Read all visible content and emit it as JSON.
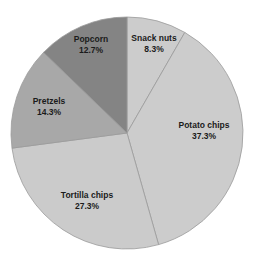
{
  "chart_data": {
    "type": "pie",
    "title": "",
    "subtitle": "",
    "xlabel": "",
    "ylabel": "",
    "grid": false,
    "legend_position": "none",
    "label_format": "name + percent",
    "start_angle_deg": 0,
    "direction": "clockwise",
    "categories": [
      "Snack nuts",
      "Potato chips",
      "Tortilla chips",
      "Pretzels",
      "Popcorn"
    ],
    "values": [
      8.3,
      37.3,
      27.3,
      14.3,
      12.7
    ],
    "units": "percent",
    "total": 99.9,
    "slices": [
      {
        "name": "Snack nuts",
        "percent_label": "8.3%",
        "value": 8.3,
        "color": "#cccccc",
        "start_deg": 0.0,
        "end_deg": 29.9
      },
      {
        "name": "Potato chips",
        "percent_label": "37.3%",
        "value": 37.3,
        "color": "#cccccc",
        "start_deg": 29.9,
        "end_deg": 164.2
      },
      {
        "name": "Tortilla chips",
        "percent_label": "27.3%",
        "value": 27.3,
        "color": "#cbcbcb",
        "start_deg": 164.2,
        "end_deg": 262.5
      },
      {
        "name": "Pretzels",
        "percent_label": "14.3%",
        "value": 14.3,
        "color": "#a8a8a8",
        "start_deg": 262.5,
        "end_deg": 314.0
      },
      {
        "name": "Popcorn",
        "percent_label": "12.7%",
        "value": 12.7,
        "color": "#848484",
        "start_deg": 314.0,
        "end_deg": 360.0
      }
    ],
    "geometry": {
      "center_x": 127,
      "center_y": 133,
      "radius": 116
    },
    "colors": {
      "background": "#ffffff",
      "slice_light": "#cccccc",
      "slice_medium": "#a8a8a8",
      "slice_dark": "#848484",
      "slice_outline": "#9a9a9a",
      "label_text": "#1b1b1b"
    }
  }
}
